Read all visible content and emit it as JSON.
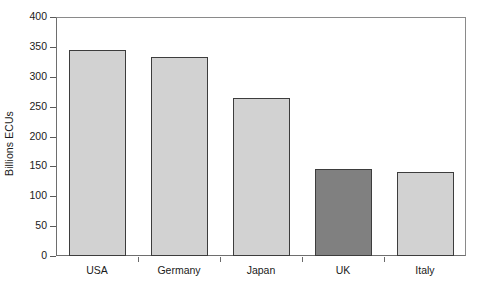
{
  "chart_data": {
    "type": "bar",
    "title": "",
    "xlabel": "",
    "ylabel": "Billions ECUs",
    "categories": [
      "USA",
      "Germany",
      "Japan",
      "UK",
      "Italy"
    ],
    "values": [
      345,
      333,
      264,
      146,
      140
    ],
    "ylim": [
      0,
      400
    ],
    "ytick_values": [
      0,
      50,
      100,
      150,
      200,
      250,
      300,
      350,
      400
    ],
    "ytick_labels": [
      "0",
      "50",
      "100",
      "150",
      "200",
      "250",
      "300",
      "350",
      "400"
    ],
    "grid": false,
    "legend": null,
    "highlight_category": "UK",
    "colors": {
      "bar_fill": "#d2d2d2",
      "bar_highlight_fill": "#808080",
      "bar_border": "#3d3d3d",
      "axis": "#6e6e6e",
      "text": "#1a1a1a",
      "background": "#ffffff"
    }
  }
}
